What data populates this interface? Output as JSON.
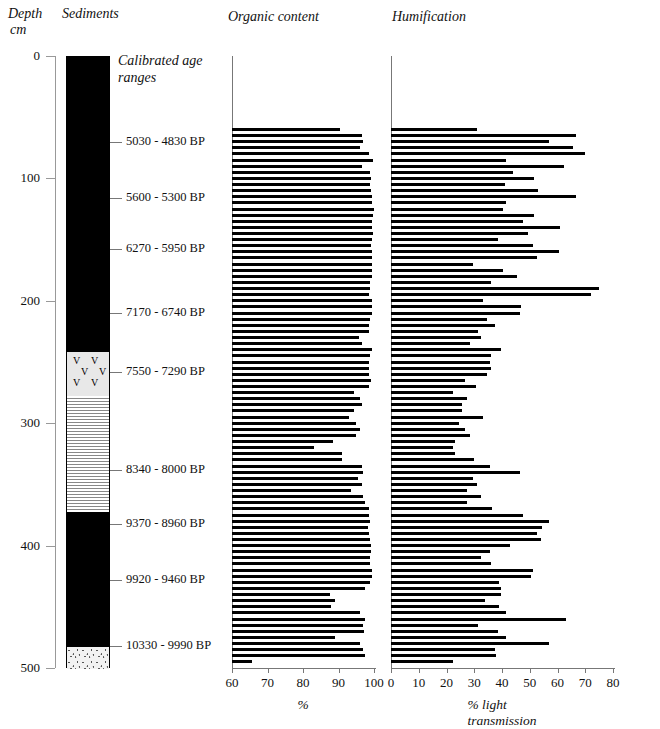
{
  "header": {
    "depth_title": "Depth",
    "depth_unit": "cm",
    "sediments_title": "Sediments",
    "organic_title": "Organic content",
    "humification_title": "Humification",
    "calibrated_title": "Calibrated age\nranges"
  },
  "depth_axis": {
    "label": "Depth",
    "unit": "cm",
    "min": 0,
    "max": 500,
    "ticks": [
      0,
      100,
      200,
      300,
      400,
      500
    ]
  },
  "calibrated_ages": [
    {
      "depth": 70,
      "label": "5030 - 4830 BP"
    },
    {
      "depth": 116,
      "label": "5600 - 5300 BP"
    },
    {
      "depth": 158,
      "label": "6270 - 5950 BP"
    },
    {
      "depth": 210,
      "label": "7170 - 6740 BP"
    },
    {
      "depth": 258,
      "label": "7550 - 7290 BP"
    },
    {
      "depth": 338,
      "label": "8340 - 8000 BP"
    },
    {
      "depth": 382,
      "label": "9370 - 8960 BP"
    },
    {
      "depth": 428,
      "label": "9920 - 9460 BP"
    },
    {
      "depth": 482,
      "label": "10330 - 9990 BP"
    }
  ],
  "sediment_column": {
    "title": "Sediments",
    "zones": [
      {
        "name": "peat",
        "from": 0,
        "to": 241,
        "pattern": "solid-black"
      },
      {
        "name": "clay-gyttja",
        "from": 241,
        "to": 277,
        "pattern": "v-marks"
      },
      {
        "name": "laminated-silt",
        "from": 277,
        "to": 372,
        "pattern": "horizontal-lines"
      },
      {
        "name": "peat-lower",
        "from": 372,
        "to": 482,
        "pattern": "solid-black"
      },
      {
        "name": "sand",
        "from": 482,
        "to": 500,
        "pattern": "stipple"
      }
    ]
  },
  "chart_data": [
    {
      "type": "bar",
      "title": "Organic content",
      "xlabel": "%",
      "ylabel": "Depth cm",
      "orientation": "horizontal",
      "xlim": [
        60,
        100
      ],
      "ylim": [
        0,
        500
      ],
      "xticks": [
        60,
        70,
        80,
        90,
        100
      ],
      "grid": false,
      "depths": [
        60,
        65,
        70,
        75,
        80,
        85,
        90,
        95,
        100,
        105,
        110,
        115,
        120,
        125,
        130,
        135,
        140,
        145,
        150,
        155,
        160,
        165,
        170,
        175,
        180,
        185,
        190,
        195,
        200,
        205,
        210,
        215,
        220,
        225,
        230,
        235,
        240,
        245,
        250,
        255,
        260,
        265,
        270,
        275,
        280,
        285,
        290,
        295,
        300,
        305,
        310,
        315,
        320,
        325,
        330,
        335,
        340,
        345,
        350,
        355,
        360,
        365,
        370,
        375,
        380,
        385,
        390,
        395,
        400,
        405,
        410,
        415,
        420,
        425,
        430,
        435,
        440,
        445,
        450,
        455,
        460,
        465,
        470,
        475,
        480,
        485,
        490,
        495
      ],
      "values": [
        90.5,
        96.5,
        96.8,
        96.0,
        98.5,
        99.8,
        96.5,
        99.0,
        99.2,
        99.0,
        99.1,
        99.4,
        99.3,
        99.9,
        99.6,
        99.5,
        99.5,
        99.6,
        99.5,
        99.2,
        99.3,
        99.5,
        99.4,
        99.5,
        99.3,
        99.0,
        98.8,
        98.5,
        99.3,
        99.4,
        99.3,
        99.0,
        98.7,
        98.5,
        95.7,
        96.5,
        99.3,
        98.8,
        98.5,
        98.5,
        98.6,
        99.2,
        98.5,
        94.5,
        96.0,
        96.5,
        94.5,
        93.0,
        95.0,
        96.0,
        94.8,
        88.5,
        83.0,
        91.0,
        91.0,
        96.5,
        97.0,
        95.5,
        96.5,
        93.5,
        97.0,
        97.5,
        98.5,
        98.5,
        98.8,
        98.3,
        98.6,
        98.9,
        99.2,
        99.2,
        99.0,
        99.0,
        99.4,
        99.4,
        98.9,
        97.5,
        87.5,
        89.0,
        88.0,
        96.0,
        97.5,
        96.8,
        97.3,
        89.0,
        96.0,
        97.0,
        97.5,
        65.5
      ]
    },
    {
      "type": "bar",
      "title": "Humification",
      "xlabel": "% light transmission",
      "ylabel": "Depth cm",
      "orientation": "horizontal",
      "xlim": [
        0,
        80
      ],
      "ylim": [
        0,
        500
      ],
      "xticks": [
        0,
        10,
        20,
        30,
        40,
        50,
        60,
        70,
        80
      ],
      "grid": false,
      "depths": [
        60,
        65,
        70,
        75,
        80,
        85,
        90,
        95,
        100,
        105,
        110,
        115,
        120,
        125,
        130,
        135,
        140,
        145,
        150,
        155,
        160,
        165,
        170,
        175,
        180,
        185,
        190,
        195,
        200,
        205,
        210,
        215,
        220,
        225,
        230,
        235,
        240,
        245,
        250,
        255,
        260,
        265,
        270,
        275,
        280,
        285,
        290,
        295,
        300,
        305,
        310,
        315,
        320,
        325,
        330,
        335,
        340,
        345,
        350,
        355,
        360,
        365,
        370,
        375,
        380,
        385,
        390,
        395,
        400,
        405,
        410,
        415,
        420,
        425,
        430,
        435,
        440,
        445,
        450,
        455,
        460,
        465,
        470,
        475,
        480,
        485,
        490,
        495
      ],
      "values": [
        31.0,
        66.5,
        57.0,
        65.5,
        70.0,
        41.5,
        62.5,
        44.0,
        51.5,
        41.0,
        53.0,
        66.5,
        41.5,
        40.5,
        51.5,
        47.5,
        61.0,
        49.5,
        38.5,
        51.0,
        60.5,
        52.5,
        29.5,
        40.5,
        45.5,
        36.0,
        75.0,
        72.0,
        33.0,
        47.0,
        46.5,
        34.5,
        37.5,
        31.5,
        32.5,
        28.5,
        39.5,
        36.0,
        35.5,
        36.0,
        34.5,
        26.5,
        30.5,
        22.5,
        27.5,
        25.5,
        25.5,
        33.0,
        24.5,
        26.5,
        28.5,
        23.0,
        22.5,
        23.0,
        30.0,
        35.5,
        46.5,
        29.5,
        31.0,
        27.5,
        32.5,
        27.5,
        36.5,
        47.5,
        57.0,
        54.5,
        52.5,
        54.0,
        43.0,
        35.5,
        32.5,
        36.0,
        51.0,
        50.5,
        39.0,
        39.5,
        39.5,
        34.0,
        39.0,
        41.5,
        63.0,
        31.5,
        38.5,
        41.5,
        57.0,
        37.5,
        38.0,
        22.5
      ]
    }
  ]
}
